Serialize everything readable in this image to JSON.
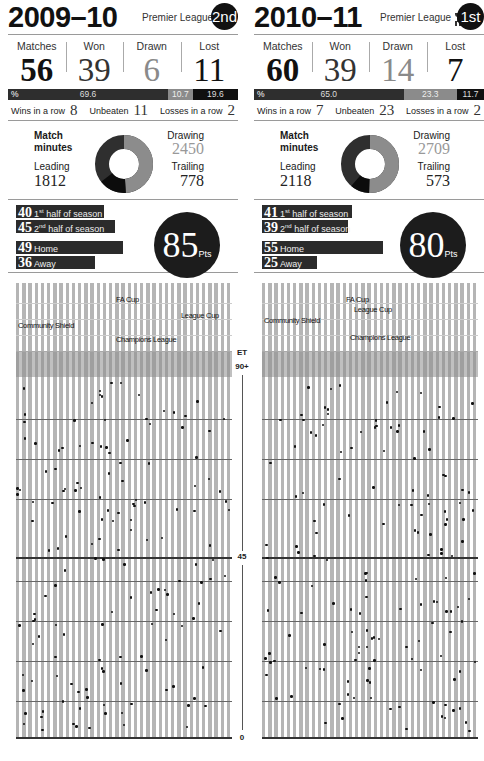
{
  "seasons": [
    {
      "year": "2009–10",
      "league": "Premier League",
      "trophy": false,
      "position": "2nd",
      "stats": {
        "matches_label": "Matches",
        "matches": "56",
        "won_label": "Won",
        "won": "39",
        "drawn_label": "Drawn",
        "drawn": "6",
        "lost_label": "Lost",
        "lost": "11"
      },
      "pct": {
        "sign": "%",
        "won": "69.6",
        "drawn": "10.7",
        "lost": "19.6"
      },
      "streaks": {
        "wins_label": "Wins in a row",
        "wins": "8",
        "unbeaten_label": "Unbeaten",
        "unbeaten": "11",
        "losses_label": "Losses in a row",
        "losses": "2"
      },
      "minutes": {
        "title_line1": "Match",
        "title_line2": "minutes",
        "leading_label": "Leading",
        "leading": "1812",
        "drawing_label": "Drawing",
        "drawing": "2450",
        "trailing_label": "Trailing",
        "trailing": "778"
      },
      "points": {
        "first_half": "40",
        "first_half_label": "half of season",
        "first_sup": "st",
        "second_half": "45",
        "second_half_label": "half of season",
        "second_sup": "nd",
        "home": "49",
        "home_label": "Home",
        "away": "36",
        "away_label": "Away",
        "total": "85",
        "unit": "Pts"
      },
      "competitions": [
        "FA Cup",
        "League Cup",
        "Community Shield",
        "Champions League"
      ]
    },
    {
      "year": "2010–11",
      "league": "Premier League",
      "trophy": true,
      "position": "1st",
      "stats": {
        "matches_label": "Matches",
        "matches": "60",
        "won_label": "Won",
        "won": "39",
        "drawn_label": "Drawn",
        "drawn": "14",
        "lost_label": "Lost",
        "lost": "7"
      },
      "pct": {
        "sign": "%",
        "won": "65.0",
        "drawn": "23.3",
        "lost": "11.7"
      },
      "streaks": {
        "wins_label": "Wins in a row",
        "wins": "7",
        "unbeaten_label": "Unbeaten",
        "unbeaten": "23",
        "losses_label": "Losses in a row",
        "losses": "2"
      },
      "minutes": {
        "title_line1": "Match",
        "title_line2": "minutes",
        "leading_label": "Leading",
        "leading": "2118",
        "drawing_label": "Drawing",
        "drawing": "2709",
        "trailing_label": "Trailing",
        "trailing": "573"
      },
      "points": {
        "first_half": "41",
        "first_half_label": "half of season",
        "first_sup": "st",
        "second_half": "39",
        "second_half_label": "half of season",
        "second_sup": "nd",
        "home": "55",
        "home_label": "Home",
        "away": "25",
        "away_label": "Away",
        "total": "80",
        "unit": "Pts"
      },
      "competitions": [
        "FA Cup",
        "League Cup",
        "Community Shield",
        "Champions League"
      ]
    }
  ],
  "axis": {
    "et": "ET",
    "ninety": "90+",
    "mid": "45",
    "zero": "0"
  },
  "chart_data": [
    {
      "type": "bar",
      "title": "2009–10 results",
      "categories": [
        "Won",
        "Drawn",
        "Lost"
      ],
      "values": [
        39,
        6,
        11
      ],
      "percent": [
        69.6,
        10.7,
        19.6
      ]
    },
    {
      "type": "bar",
      "title": "2010–11 results",
      "categories": [
        "Won",
        "Drawn",
        "Lost"
      ],
      "values": [
        39,
        14,
        7
      ],
      "percent": [
        65.0,
        23.3,
        11.7
      ]
    },
    {
      "type": "pie",
      "title": "Match minutes 2009–10",
      "categories": [
        "Leading",
        "Drawing",
        "Trailing"
      ],
      "values": [
        1812,
        2450,
        778
      ]
    },
    {
      "type": "pie",
      "title": "Match minutes 2010–11",
      "categories": [
        "Leading",
        "Drawing",
        "Trailing"
      ],
      "values": [
        2118,
        2709,
        573
      ]
    },
    {
      "type": "bar",
      "title": "Points 2009–10",
      "categories": [
        "1st half of season",
        "2nd half of season",
        "Home",
        "Away",
        "Total"
      ],
      "values": [
        40,
        45,
        49,
        36,
        85
      ]
    },
    {
      "type": "bar",
      "title": "Points 2010–11",
      "categories": [
        "1st half of season",
        "2nd half of season",
        "Home",
        "Away",
        "Total"
      ],
      "values": [
        41,
        39,
        55,
        25,
        80
      ]
    },
    {
      "type": "scatter",
      "title": "Goal minutes per match",
      "ylabel": "Minute",
      "yticks": [
        "0",
        "45",
        "90+",
        "ET"
      ],
      "ylim": [
        0,
        120
      ],
      "series": [
        {
          "name": "2009–10",
          "matches": 56
        },
        {
          "name": "2010–11",
          "matches": 60
        }
      ]
    }
  ]
}
